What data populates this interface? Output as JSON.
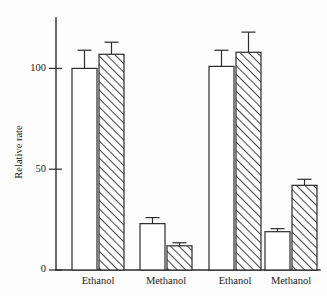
{
  "figure": {
    "background_color": "#fdfdfd",
    "ink_color": "#2b2b2b"
  },
  "axes": {
    "y_axis_label": "Relative rate",
    "y_ticks": [
      0,
      50,
      100
    ],
    "y_tick_labels": [
      "0",
      "50",
      "100"
    ],
    "x_tick_labels": [
      "Ethanol",
      "Methanol",
      "Ethanol",
      "Methanol"
    ]
  },
  "legend": {
    "open_series_name": "Open bar",
    "hatched_series_name": "Hatched bar"
  },
  "chart_data": {
    "type": "bar",
    "title": "",
    "subtitle": "",
    "xlabel": "",
    "ylabel": "Relative rate",
    "ylim": [
      0,
      125
    ],
    "yticks": [
      0,
      50,
      100
    ],
    "grid": false,
    "legend_position": "none",
    "categories": [
      "Ethanol",
      "Methanol",
      "Ethanol",
      "Methanol"
    ],
    "series": [
      {
        "name": "Open bar",
        "style": "open",
        "fill": "#ffffff",
        "values": [
          100,
          23,
          101,
          19
        ],
        "errors": [
          9,
          3,
          8,
          1.5
        ]
      },
      {
        "name": "Hatched bar",
        "style": "hatched",
        "fill": "diagonal-hatch",
        "values": [
          107,
          12,
          108,
          42
        ],
        "errors": [
          6,
          1.5,
          10,
          3
        ]
      }
    ],
    "annotations": [
      {
        "text": "Ethanol",
        "position": "x-axis group 1"
      },
      {
        "text": "Methanol",
        "position": "x-axis group 2"
      },
      {
        "text": "Ethanol",
        "position": "x-axis group 3"
      },
      {
        "text": "Methanol",
        "position": "x-axis group 4"
      }
    ]
  }
}
